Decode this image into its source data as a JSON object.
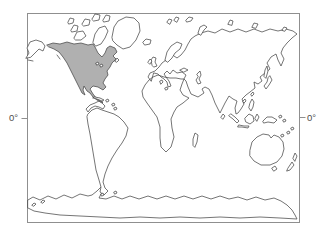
{
  "figure": {
    "type": "world-outline-range-map",
    "highlighted_region": "North America (Canada, United States, Mexico)",
    "background": "#ffffff",
    "frame_color": "#8f8f8f",
    "outline_color": "#474747",
    "land_fill": "#ffffff",
    "highlight_fill": "#b0b0b0",
    "label_color": "#4d4d4d",
    "labels": {
      "left": "0°",
      "right": "0°"
    }
  },
  "map": {
    "width": 330,
    "height": 234,
    "frame": {
      "x": 27.5,
      "y": 13.5,
      "w": 272,
      "h": 209
    },
    "ticks": [
      {
        "name": "equator-tick-left",
        "d": "M21.5,118.5 L27.5,118.5"
      },
      {
        "name": "equator-tick-right",
        "d": "M299.5,117.5 L305.5,117.5"
      }
    ],
    "regions": [
      {
        "name": "antarctica",
        "kind": "land",
        "d": "M28,200 33,197 40,200 48,196 56,199 64,195 72,198 80,194 88,196 92,195 97,191 101,187 104,190 101,194 99,198 106,199 114,196 122,199 130,196 139,199 148,196 157,199 166,196 175,199 184,196 193,199 202,196 211,199 220,196 229,199 238,197 247,200 256,197 265,200 274,198 281,201 287,205 292,210 295,215 297,219 280,218 260,217 240,218 220,217 200,218 180,217 160,218 140,217 120,218 100,217 80,216 60,215 45,213 34,211 28,208 Z"
      },
      {
        "name": "afro-eurasia",
        "kind": "land",
        "d": "M151,81 148,77 150,73 155,71 159,67 162,63 166,60 169,57 171,53 174,56 177,58 181,55 185,50 188,44 191,39 195,36 201,33 208,31 215,33 222,29 230,32 238,29 246,32 254,29 262,32 270,29 278,31 286,29 293,31 297,34 292,38 287,43 283,48 281,53 284,59 281,66 278,60 276,54 271,57 267,63 270,69 265,73 260,77 262,81 258,84 254,82 255,88 250,92 246,95 242,99 244,104 241,109 238,113 236,114 235,108 237,101 233,99 229,96 225,103 220,113 215,103 212,95 209,89 205,87 202,89 204,93 198,97 191,94 188,87 186,81 184,79 182,84 180,90 183,95 189,98 183,103 177,107 174,112 171,119 172,128 174,137 171,147 166,152 161,147 160,138 160,127 157,117 152,110 147,103 143,97 142,91 145,85 149,80 153,77 158,75 164,77 170,78 176,78 181,79 184,79 186,75 182,72 177,73 173,70 170,74 167,71 164,74 166,77 169,81 171,86 168,87 167,82 164,79 161,77 158,74 154,73 Z"
      },
      {
        "name": "caspian-sea",
        "kind": "water",
        "d": "M197,74 200,71 201,75 199,79 201,83 198,84 196,80 198,77 Z"
      },
      {
        "name": "black-sea",
        "kind": "water",
        "d": "M180,70 184,68 188,70 184,72 Z"
      },
      {
        "name": "alaska",
        "kind": "land",
        "d": "M26,58 29,53 27,48 30,42 36,40 42,42 45,46 43,51 39,49 35,53 31,57 Z"
      },
      {
        "name": "central-america",
        "kind": "land",
        "d": "M102,103 105,106 103,109 99,107 95,106 91,108 88,112 86,109 90,105 95,103 99,101 Z"
      },
      {
        "name": "south-america",
        "kind": "land",
        "d": "M88,114 92,110 97,108 102,110 108,112 114,114 119,117 124,122 128,128 126,136 122,143 117,150 112,158 108,166 105,174 103,182 105,188 108,191 104,195 100,192 101,187 99,180 96,170 94,158 92,146 90,134 88,124 87,117 Z"
      },
      {
        "name": "north-america-range",
        "kind": "highlight",
        "d": "M47,45 53,43 60,44 67,42 74,44 81,43 88,45 93,44 95,47 98,53 102,57 105,53 107,48 110,46 115,48 117,52 113,56 116,59 112,63 110,67 107,71 108,75 105,79 103,83 106,87 103,90 98,87 93,86 90,89 93,94 97,99 100,101 103,102 102,103 97,100 93,97 90,93 87,91 84,86 83,90 85,95 82,93 79,87 76,81 73,75 70,69 67,63 63,57 59,52 54,49 49,47 Z"
      },
      {
        "name": "greenland",
        "kind": "land",
        "d": "M112,37 114,27 118,21 126,17 134,18 139,23 140,31 136,40 130,47 123,49 117,45 113,41 Z"
      },
      {
        "name": "arctic-island-victoria",
        "kind": "land",
        "d": "M74,38 77,32 83,31 86,36 81,40 76,40 Z"
      },
      {
        "name": "arctic-island-banks",
        "kind": "land",
        "d": "M71,30 74,25 78,26 77,31 72,32 Z"
      },
      {
        "name": "arctic-island-1",
        "kind": "land",
        "d": "M82,24 85,19 90,20 89,25 84,26 Z"
      },
      {
        "name": "arctic-island-2",
        "kind": "land",
        "d": "M92,19 95,14 100,15 99,20 94,21 Z"
      },
      {
        "name": "arctic-island-baffin",
        "kind": "land",
        "d": "M93,42 95,34 99,28 105,26 108,31 105,38 101,44 96,46 Z"
      },
      {
        "name": "arctic-island-ellesmere",
        "kind": "land",
        "d": "M103,20 106,15 110,16 109,21 104,22 Z"
      },
      {
        "name": "arctic-island-3",
        "kind": "land",
        "d": "M68,22 70,18 74,19 73,23 69,24 Z"
      },
      {
        "name": "iceland",
        "kind": "land",
        "d": "M143,42 146,39 151,40 150,44 145,45 Z"
      },
      {
        "name": "great-britain",
        "kind": "land",
        "d": "M152,65 151,60 153,57 156,58 155,62 157,66 154,67 Z"
      },
      {
        "name": "ireland",
        "kind": "land",
        "d": "M148,62 150,59 152,61 150,64 Z"
      },
      {
        "name": "scandinavia",
        "kind": "land",
        "d": "M165,60 167,52 171,46 177,42 182,44 180,49 175,53 172,58 168,62 Z"
      },
      {
        "name": "svalbard-1",
        "kind": "land",
        "d": "M167,22 169,19 172,20 170,24 Z"
      },
      {
        "name": "svalbard-2",
        "kind": "land",
        "d": "M174,20 176,17 179,18 177,22 Z"
      },
      {
        "name": "franz-josef-land",
        "kind": "land",
        "d": "M186,20 189,17 193,18 191,21 187,22 Z"
      },
      {
        "name": "novaya-zemlya",
        "kind": "land",
        "d": "M198,33 200,27 204,25 207,27 204,30 201,35 Z"
      },
      {
        "name": "severnaya-zemlya",
        "kind": "land",
        "d": "M228,24 230,20 233,21 232,25 Z"
      },
      {
        "name": "new-siberian-islands",
        "kind": "land",
        "d": "M252,27 254,23 258,24 256,28 Z"
      },
      {
        "name": "wrangel-island",
        "kind": "land",
        "d": "M282,30 284,27 287,28 285,31 Z"
      },
      {
        "name": "sakhalin",
        "kind": "land",
        "d": "M264,76 265,70 267,66 268,71 266,78 Z"
      },
      {
        "name": "japan",
        "kind": "land",
        "d": "M270,76 272,80 269,85 266,89 264,86 267,82 268,78 Z"
      },
      {
        "name": "taiwan",
        "kind": "land",
        "d": "M251,94 253,92 254,94 252,96 Z"
      },
      {
        "name": "hainan",
        "kind": "land",
        "d": "M243,101 245,99 246,101 244,103 Z"
      },
      {
        "name": "sri-lanka",
        "kind": "land",
        "d": "M221,117 223,114 225,116 223,119 Z"
      },
      {
        "name": "philippines",
        "kind": "land",
        "d": "M250,103 252,99 254,102 253,107 251,111 249,108 Z"
      },
      {
        "name": "borneo",
        "kind": "land",
        "d": "M245,118 249,114 253,116 254,121 250,124 246,122 Z"
      },
      {
        "name": "sumatra",
        "kind": "land",
        "d": "M231,114 235,117 239,121 237,123 233,119 229,116 Z"
      },
      {
        "name": "java",
        "kind": "land",
        "d": "M239,125 244,126 249,126 248,128 242,127 238,127 Z"
      },
      {
        "name": "sulawesi",
        "kind": "land",
        "d": "M255,118 257,114 259,117 257,121 Z"
      },
      {
        "name": "new-guinea",
        "kind": "land",
        "d": "M263,121 267,117 272,117 277,120 274,123 268,122 264,123 Z"
      },
      {
        "name": "australia",
        "kind": "land",
        "d": "M250,150 252,142 257,137 263,134 269,135 271,138 274,135 279,137 283,142 284,149 282,156 277,162 270,165 261,165 254,161 250,156 Z"
      },
      {
        "name": "tasmania",
        "kind": "land",
        "d": "M272,168 275,166 277,169 274,171 Z"
      },
      {
        "name": "new-zealand-north",
        "kind": "land",
        "d": "M293,158 295,153 297,156 295,161 Z"
      },
      {
        "name": "new-zealand-south",
        "kind": "land",
        "d": "M288,168 292,162 294,165 290,170 287,171 Z"
      },
      {
        "name": "madagascar",
        "kind": "land",
        "d": "M193,145 193,139 195,133 198,135 197,142 195,147 Z"
      },
      {
        "name": "cuba",
        "kind": "land",
        "d": "M95,97 100,98 104,100 102,101 97,99 93,98 Z"
      },
      {
        "name": "hispaniola",
        "kind": "land",
        "d": "M106,100 108,99 109,101 107,102 Z"
      },
      {
        "name": "lesser-antilles-1",
        "kind": "land",
        "d": "M112,104 114,103 115,105 113,106 Z"
      },
      {
        "name": "lesser-antilles-2",
        "kind": "land",
        "d": "M114,108 116,107 117,109 115,110 Z"
      },
      {
        "name": "newfoundland",
        "kind": "land",
        "d": "M115,61 117,58 119,60 117,62 Z"
      },
      {
        "name": "sardinia",
        "kind": "land",
        "d": "M160,81 162,80 163,82 161,84 Z"
      },
      {
        "name": "sicily",
        "kind": "land",
        "d": "M165,88 167,87 168,89 166,90 Z"
      },
      {
        "name": "pacific-island-1",
        "kind": "land",
        "d": "M279,116 281,115 282,117 280,118 Z"
      },
      {
        "name": "pacific-island-2",
        "kind": "land",
        "d": "M283,120 285,119 286,121 284,122 Z"
      },
      {
        "name": "pacific-island-3",
        "kind": "land",
        "d": "M287,132 289,131 290,133 288,134 Z"
      },
      {
        "name": "pacific-island-4",
        "kind": "land",
        "d": "M281,135 283,134 284,136 282,137 Z"
      },
      {
        "name": "pacific-island-5",
        "kind": "land",
        "d": "M291,128 293,127 294,129 292,130 Z"
      },
      {
        "name": "falkland-islands",
        "kind": "land",
        "d": "M114,192 116,191 117,193 115,194 Z"
      },
      {
        "name": "south-shetland-1",
        "kind": "land",
        "d": "M32,205 34,203 36,204 34,206 Z"
      },
      {
        "name": "south-shetland-2",
        "kind": "land",
        "d": "M41,202 43,200 45,201 43,203 Z"
      },
      {
        "name": "antarctic-peninsula-island",
        "kind": "land",
        "d": "M101,194 103,193 104,195 102,196 Z"
      },
      {
        "name": "great-lake-1",
        "kind": "water",
        "d": "M96,63 98,62 99,64 97,65 Z"
      },
      {
        "name": "great-lake-2",
        "kind": "water",
        "d": "M100,65 102,64 103,66 101,67 Z"
      },
      {
        "name": "vancouver-island",
        "kind": "line",
        "d": "M57,55 60,59"
      },
      {
        "name": "aleutian-chain",
        "kind": "line",
        "d": "M28,60 33,61"
      }
    ]
  }
}
